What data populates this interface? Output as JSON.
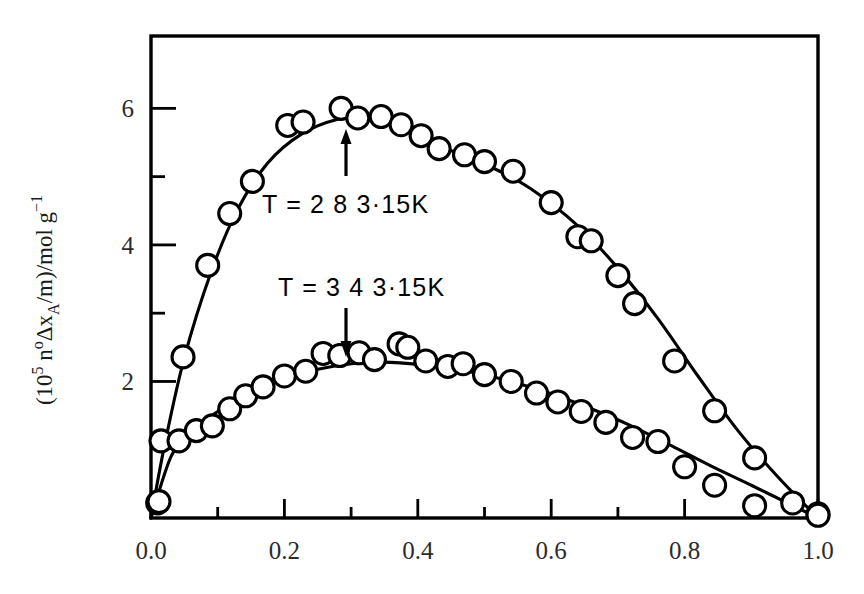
{
  "figure": {
    "background_color": "#ffffff",
    "ink_color": "#000000",
    "marker_style": "open-circle",
    "marker_radius_px": 11
  },
  "axes": {
    "x": {
      "label": "",
      "min": 0.0,
      "max": 1.0,
      "major_ticks": [
        0.0,
        0.2,
        0.4,
        0.6,
        0.8,
        1.0
      ],
      "major_tick_labels": [
        "0.0",
        "0.2",
        "0.4",
        "0.6",
        "0.8",
        "1.0"
      ],
      "minor_ticks": [
        0.1,
        0.3,
        0.5,
        0.7,
        0.9
      ]
    },
    "y": {
      "label_parts": {
        "open_paren": "(",
        "ten": "10",
        "ten_exp": "5",
        "n": "n",
        "n_exp": "o",
        "delta_x": "Δx",
        "x_sub": "A",
        "per_m": "/m)",
        "per_mol": "/mol",
        "g": "g",
        "g_exp": "−1"
      },
      "label_text": "(10⁵ nᵒΔxₐ/m)/mol g⁻¹",
      "min": 0.0,
      "max": 7.06,
      "major_ticks": [
        2,
        4,
        6
      ],
      "major_tick_labels": [
        "2",
        "4",
        "6"
      ],
      "minor_ticks": [
        3,
        5
      ]
    }
  },
  "annotations": [
    {
      "id": "upper-series-callout",
      "text": "T = 2 8 3·15K",
      "arrow": "up",
      "x_px": 262,
      "y_px": 213
    },
    {
      "id": "lower-series-callout",
      "text": "T = 3 4 3·15K",
      "arrow": "down",
      "x_px": 278,
      "y_px": 296
    }
  ],
  "chart_data": {
    "type": "scatter",
    "title": "",
    "xlabel": "",
    "ylabel": "(10⁵ nᵒΔxₐ/m)/mol g⁻¹",
    "xlim": [
      0.0,
      1.0
    ],
    "ylim": [
      0.0,
      7.06
    ],
    "grid": false,
    "legend": "inline-annotations",
    "series": [
      {
        "name": "T = 2 8 3·15K",
        "marker": "open-circle",
        "points": [
          [
            0.01,
            0.22
          ],
          [
            0.015,
            1.13
          ],
          [
            0.048,
            2.36
          ],
          [
            0.085,
            3.7
          ],
          [
            0.118,
            4.46
          ],
          [
            0.152,
            4.93
          ],
          [
            0.205,
            5.75
          ],
          [
            0.228,
            5.8
          ],
          [
            0.285,
            6.0
          ],
          [
            0.31,
            5.86
          ],
          [
            0.345,
            5.88
          ],
          [
            0.375,
            5.76
          ],
          [
            0.405,
            5.6
          ],
          [
            0.432,
            5.41
          ],
          [
            0.47,
            5.32
          ],
          [
            0.5,
            5.22
          ],
          [
            0.543,
            5.08
          ],
          [
            0.6,
            4.62
          ],
          [
            0.64,
            4.12
          ],
          [
            0.66,
            4.06
          ],
          [
            0.7,
            3.55
          ],
          [
            0.725,
            3.14
          ],
          [
            0.785,
            2.3
          ],
          [
            0.845,
            1.57
          ],
          [
            0.905,
            0.88
          ],
          [
            0.962,
            0.22
          ],
          [
            1.0,
            0.06
          ]
        ],
        "curve_fit": true,
        "peak_x": 0.31,
        "peak_y": 5.88
      },
      {
        "name": "T = 3 4 3·15K",
        "marker": "open-circle",
        "points": [
          [
            0.012,
            0.24
          ],
          [
            0.042,
            1.13
          ],
          [
            0.068,
            1.28
          ],
          [
            0.092,
            1.35
          ],
          [
            0.118,
            1.6
          ],
          [
            0.142,
            1.79
          ],
          [
            0.168,
            1.92
          ],
          [
            0.2,
            2.08
          ],
          [
            0.232,
            2.15
          ],
          [
            0.258,
            2.41
          ],
          [
            0.283,
            2.38
          ],
          [
            0.312,
            2.42
          ],
          [
            0.335,
            2.32
          ],
          [
            0.372,
            2.55
          ],
          [
            0.385,
            2.5
          ],
          [
            0.412,
            2.3
          ],
          [
            0.445,
            2.22
          ],
          [
            0.468,
            2.26
          ],
          [
            0.5,
            2.1
          ],
          [
            0.54,
            2.0
          ],
          [
            0.578,
            1.83
          ],
          [
            0.61,
            1.7
          ],
          [
            0.645,
            1.56
          ],
          [
            0.682,
            1.4
          ],
          [
            0.722,
            1.18
          ],
          [
            0.76,
            1.12
          ],
          [
            0.8,
            0.75
          ],
          [
            0.845,
            0.48
          ],
          [
            0.905,
            0.18
          ],
          [
            1.0,
            0.04
          ]
        ],
        "curve_fit": true,
        "peak_x": 0.33,
        "peak_y": 2.28
      }
    ]
  }
}
